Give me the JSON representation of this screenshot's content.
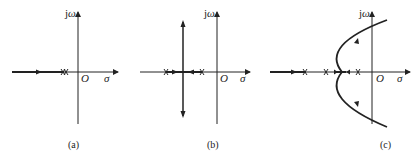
{
  "figure": {
    "axis_labels": {
      "imag": "jω",
      "real": "σ",
      "origin": "O"
    },
    "panels": [
      {
        "id": "a",
        "caption": "(a)",
        "description": "Two coincident poles on negative real axis; locus runs left along real axis"
      },
      {
        "id": "b",
        "caption": "(b)",
        "description": "Two distinct real poles; branches meet and break away vertically"
      },
      {
        "id": "c",
        "caption": "(c)",
        "description": "Multiple real poles; complex branches curve into right half-plane"
      }
    ],
    "colors": {
      "ink": "#222222",
      "background": "#ffffff"
    }
  }
}
